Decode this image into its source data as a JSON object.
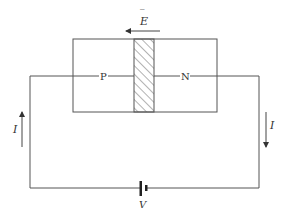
{
  "diagram": {
    "field_label": "E",
    "field_bar": "‾",
    "regions": {
      "p_label": "P",
      "n_label": "N"
    },
    "current_left_label": "I",
    "current_right_label": "I",
    "battery_label": "V",
    "colors": {
      "line": "#555555",
      "hatch": "#666666",
      "background": "#ffffff"
    }
  }
}
